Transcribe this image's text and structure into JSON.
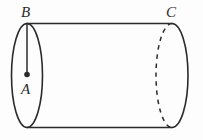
{
  "figure": {
    "name": "cylinder-diagram",
    "background_color": "#fdfdfd",
    "stroke_color": "#2b2b2b",
    "labels": {
      "center_point": "A",
      "top_left_point": "B",
      "top_right_point": "C"
    },
    "geometry": {
      "left_ellipse": {
        "cx": 27,
        "cy": 75.5,
        "rx": 15.5,
        "ry": 52
      },
      "right_ellipse": {
        "cx": 172,
        "cy": 75.5,
        "rx": 16,
        "ry": 52
      },
      "top_line": {
        "x1": 27,
        "y1": 23.5,
        "x2": 172,
        "y2": 23.5
      },
      "bottom_line": {
        "x1": 27,
        "y1": 127.5,
        "x2": 172,
        "y2": 127.5
      },
      "radius_segment": {
        "x1": 27,
        "y1": 23.5,
        "x2": 27,
        "y2": 75
      },
      "center_dot": {
        "cx": 27,
        "cy": 74.5,
        "r": 2.6
      },
      "hidden_arc_style": "dashed"
    }
  }
}
